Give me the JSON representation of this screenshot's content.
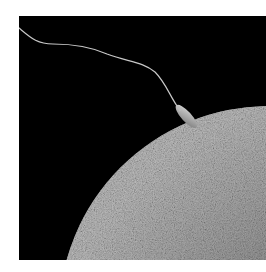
{
  "image": {
    "subject": "Scanning electron micrograph of a sperm cell attaching to the surface of an egg",
    "background_color": "#000000",
    "page_color": "#ffffff",
    "egg_color": "#8c8c8c",
    "sperm_color": "#b8b8b8"
  }
}
